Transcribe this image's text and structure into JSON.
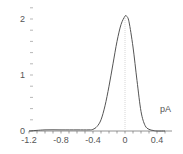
{
  "chart_data": {
    "type": "line",
    "title": "",
    "xlabel": "pA",
    "ylabel": "",
    "xlim": [
      -1.25,
      0.55
    ],
    "ylim": [
      0,
      2.2
    ],
    "x_ticks": [
      "-1.2",
      "-0.8",
      "-0.4",
      "0",
      "0.4"
    ],
    "x_tick_values": [
      -1.2,
      -0.8,
      -0.4,
      0,
      0.4
    ],
    "y_ticks": [
      "0",
      "1",
      "2"
    ],
    "y_tick_values": [
      0,
      1,
      2
    ],
    "grid": false,
    "reference_line": {
      "x": 0,
      "style": "dotted"
    },
    "series": [
      {
        "name": "distribution",
        "x": [
          -1.2,
          -1.0,
          -0.8,
          -0.6,
          -0.45,
          -0.4,
          -0.35,
          -0.3,
          -0.25,
          -0.2,
          -0.15,
          -0.1,
          -0.05,
          0.0,
          0.02,
          0.05,
          0.1,
          0.15,
          0.2,
          0.25,
          0.3,
          0.35,
          0.4,
          0.5
        ],
        "y": [
          0.0,
          0.02,
          0.02,
          0.02,
          0.02,
          0.03,
          0.08,
          0.2,
          0.45,
          0.8,
          1.2,
          1.6,
          1.9,
          2.05,
          2.05,
          1.95,
          1.5,
          0.9,
          0.35,
          0.1,
          0.03,
          0.01,
          0.0,
          0.0
        ]
      }
    ]
  },
  "labels": {
    "unit": "pA",
    "x_ticks": [
      "-1.2",
      "-0.8",
      "-0.4",
      "0",
      "0.4"
    ],
    "y_ticks": [
      "0",
      "1",
      "2"
    ]
  }
}
